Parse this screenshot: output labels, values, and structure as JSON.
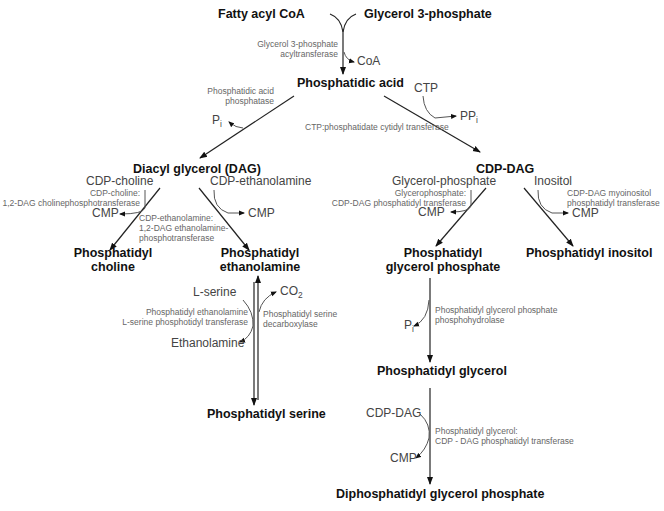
{
  "nodes": {
    "fatty_acyl_coa": "Fatty acyl CoA",
    "glycerol_3_phosphate": "Glycerol 3-phosphate",
    "phosphatidic_acid": "Phosphatidic acid",
    "dag": "Diacyl glycerol (DAG)",
    "cdp_dag": "CDP-DAG",
    "pc_line1": "Phosphatidyl",
    "pc_line2": "choline",
    "pe_line1": "Phosphatidyl",
    "pe_line2": "ethanolamine",
    "pgp_line1": "Phosphatidyl",
    "pgp_line2": "glycerol phosphate",
    "pi": "Phosphatidyl inositol",
    "ps": "Phosphatidyl serine",
    "pg": "Phosphatidyl glycerol",
    "dpgp": "Diphosphatidyl glycerol phosphate"
  },
  "substrates": {
    "coa": "CoA",
    "pi_dag": "P",
    "pi_dag_sub": "i",
    "ctp": "CTP",
    "ppi": "PP",
    "ppi_sub": "i",
    "cdp_choline": "CDP-choline",
    "cmp_choline": "CMP",
    "cdp_ethanolamine": "CDP-ethanolamine",
    "cmp_ethanolamine": "CMP",
    "glycerol_phosphate": "Glycerol-phosphate",
    "cmp_glycerol": "CMP",
    "inositol": "Inositol",
    "cmp_inositol": "CMP",
    "l_serine": "L-serine",
    "co2": "CO",
    "co2_sub": "2",
    "ethanolamine": "Ethanolamine",
    "pi_pg": "P",
    "pi_pg_sub": "i",
    "cdp_dag_2": "CDP-DAG",
    "cmp_dpgp": "CMP"
  },
  "enzymes": {
    "g3p_acyltransferase_1": "Glycerol 3-phosphate",
    "g3p_acyltransferase_2": "acyltransferase",
    "pa_phosphatase_1": "Phosphatidic acid",
    "pa_phosphatase_2": "phosphatase",
    "ctp_cytidyl": "CTP:phosphatidate cytidyl transferase",
    "choline_pt_1": "CDP-choline:",
    "choline_pt_2": "1,2-DAG cholinephosphotransferase",
    "etn_pt_1": "CDP-ethanolamine:",
    "etn_pt_2": "1,2-DAG ethanolamine-",
    "etn_pt_3": "phosphotransferase",
    "gp_pt_1": "Glycerophosphate:",
    "gp_pt_2": "CDP-DAG phosphatidyl transferase",
    "ino_pt_1": "CDP-DAG myoinositol",
    "ino_pt_2": "phosphatidyl transferase",
    "ps_synth_1": "Phosphatidyl ethanolamine",
    "ps_synth_2": "L-serine phosphotidyl transferase",
    "ps_decarb_1": "Phosphatidyl serine",
    "ps_decarb_2": "decarboxylase",
    "pgp_phosphohydrolase_1": "Phosphatidyl glycerol phosphate",
    "pgp_phosphohydrolase_2": "phosphohydrolase",
    "pg_cdp_pt_1": "Phosphatidyl glycerol:",
    "pg_cdp_pt_2": "CDP - DAG phosphatidyl transferase"
  },
  "colors": {
    "line": "#222222",
    "branch": "#555555"
  }
}
